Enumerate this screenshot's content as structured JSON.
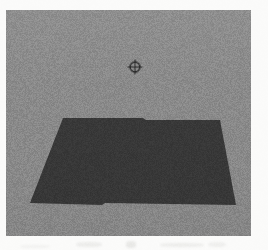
{
  "page": {
    "background_color": "#fbfbfa",
    "width": 268,
    "height": 250
  },
  "viewport": {
    "label": "3D scene viewport",
    "background_color": "#8e8e8e",
    "x": 6,
    "y": 10,
    "width": 245,
    "height": 226,
    "border_color": "#8e8e8e"
  },
  "scene": {
    "ground_plane": {
      "label": "ground plane",
      "color": "#3a3a3a",
      "shape": "quadrilateral",
      "points": "57,108 137,108 140,110 214,110 230,195 99,193 96,195 24,193"
    },
    "crosshair": {
      "label": "target reticle",
      "icon": "crosshair-icon",
      "glyph": "⊕",
      "color": "#2f2f2f",
      "center_x": 135,
      "center_y": 67,
      "radius": 4.6,
      "arm_length": 7.4,
      "stroke_width": 1.1
    }
  },
  "scan_artifacts": {
    "label": "scanner smudges",
    "color": "#e3e3e1",
    "count": 5
  },
  "grain": {
    "label": "film grain",
    "opacity": 0.42
  }
}
